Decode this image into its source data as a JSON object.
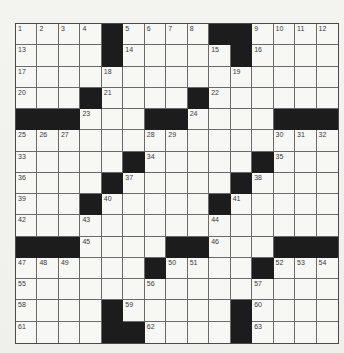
{
  "puzzle": {
    "type": "crossword",
    "rows": 15,
    "cols": 15,
    "colors": {
      "background": "#f1f1ee",
      "cell": "#f7f7f4",
      "black_cell": "#1c1c1c",
      "grid_line": "#6a6a6a",
      "number": "#3a3a3a"
    },
    "grid": [
      [
        "1",
        "2",
        "3",
        "4",
        "#",
        "5",
        "6",
        "7",
        "8",
        "#",
        "#",
        "9",
        "10",
        "11",
        "12"
      ],
      [
        "13",
        "",
        "",
        "",
        "#",
        "14",
        "",
        "",
        "",
        "15",
        "#",
        "16",
        "",
        "",
        ""
      ],
      [
        "17",
        "",
        "",
        "",
        "18",
        "",
        "",
        "",
        "",
        "",
        "19",
        "",
        "",
        "",
        ""
      ],
      [
        "20",
        "",
        "",
        "#",
        "21",
        "",
        "",
        "",
        "#",
        "22",
        "",
        "",
        "",
        "",
        ""
      ],
      [
        "#",
        "#",
        "#",
        "23",
        "",
        "",
        "#",
        "#",
        "24",
        "",
        "",
        "",
        "#",
        "#",
        "#"
      ],
      [
        "25",
        "26",
        "27",
        "",
        "",
        "",
        "28",
        "29",
        "",
        "",
        "",
        "",
        "30",
        "31",
        "32"
      ],
      [
        "33",
        "",
        "",
        "",
        "",
        "#",
        "34",
        "",
        "",
        "",
        "",
        "#",
        "35",
        "",
        ""
      ],
      [
        "36",
        "",
        "",
        "",
        "#",
        "37",
        "",
        "",
        "",
        "",
        "#",
        "38",
        "",
        "",
        ""
      ],
      [
        "39",
        "",
        "",
        "#",
        "40",
        "",
        "",
        "",
        "",
        "#",
        "41",
        "",
        "",
        "",
        ""
      ],
      [
        "42",
        "",
        "",
        "43",
        "",
        "",
        "",
        "",
        "",
        "44",
        "",
        "",
        "",
        "",
        ""
      ],
      [
        "#",
        "#",
        "#",
        "45",
        "",
        "",
        "",
        "#",
        "#",
        "46",
        "",
        "",
        "#",
        "#",
        "#"
      ],
      [
        "47",
        "48",
        "49",
        "",
        "",
        "",
        "#",
        "50",
        "51",
        "",
        "",
        "#",
        "52",
        "53",
        "54"
      ],
      [
        "55",
        "",
        "",
        "",
        "",
        "",
        "56",
        "",
        "",
        "",
        "",
        "57",
        "",
        "",
        ""
      ],
      [
        "58",
        "",
        "",
        "",
        "#",
        "59",
        "",
        "",
        "",
        "",
        "#",
        "60",
        "",
        "",
        ""
      ],
      [
        "61",
        "",
        "",
        "",
        "#",
        "#",
        "62",
        "",
        "",
        "",
        "#",
        "63",
        "",
        "",
        ""
      ]
    ]
  }
}
